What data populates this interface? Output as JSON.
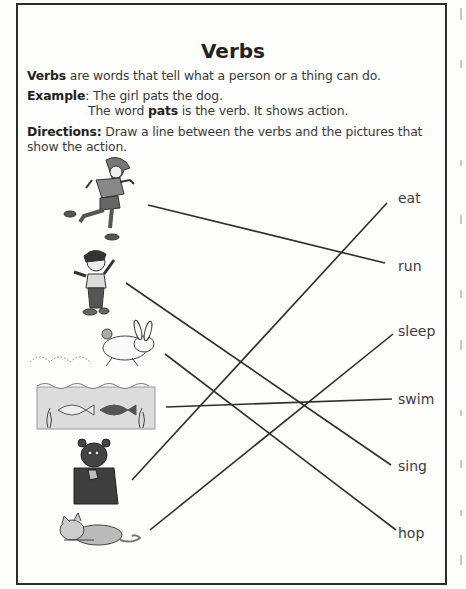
{
  "worksheet": {
    "title": "Verbs",
    "definition": {
      "bold": "Verbs",
      "text": " are words that tell what a person or a thing can do."
    },
    "example": {
      "label": "Example",
      "line1": ": The girl pats the dog.",
      "line2_pre": "The word ",
      "line2_bold": "pats",
      "line2_post": " is the verb. It shows action."
    },
    "directions": {
      "label": "Directions:",
      "line1": " Draw a line between the verbs and the pictures that",
      "line2": "show the action."
    },
    "pictures": [
      {
        "id": "boy-running",
        "description": "boy running"
      },
      {
        "id": "girl-singing",
        "description": "girl singing"
      },
      {
        "id": "rabbit-hopping",
        "description": "rabbit hopping"
      },
      {
        "id": "fish-swimming",
        "description": "fish swimming"
      },
      {
        "id": "bear-eating",
        "description": "bear eating"
      },
      {
        "id": "cat-sleeping",
        "description": "cat sleeping"
      }
    ],
    "verbs": [
      {
        "label": "eat",
        "x": 398,
        "y": 190
      },
      {
        "label": "run",
        "x": 398,
        "y": 258
      },
      {
        "label": "sleep",
        "x": 398,
        "y": 323
      },
      {
        "label": "swim",
        "x": 398,
        "y": 391
      },
      {
        "label": "sing",
        "x": 398,
        "y": 458
      },
      {
        "label": "hop",
        "x": 398,
        "y": 525
      }
    ],
    "drawn_lines": [
      {
        "from": "boy-running",
        "to": "run"
      },
      {
        "from": "girl-singing",
        "to": "sing"
      },
      {
        "from": "rabbit-hopping",
        "to": "hop"
      },
      {
        "from": "fish-swimming",
        "to": "swim"
      },
      {
        "from": "bear-eating",
        "to": "eat"
      },
      {
        "from": "cat-sleeping",
        "to": "sleep"
      }
    ],
    "colors": {
      "ink": "#2b2b2b",
      "text": "#3a3a3a",
      "water": "#dcdcdc"
    }
  }
}
